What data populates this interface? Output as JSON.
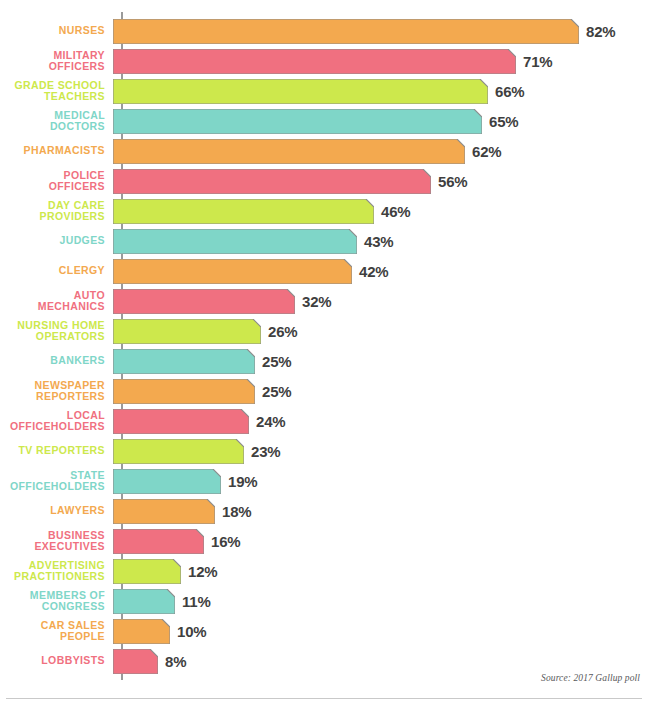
{
  "chart_data": {
    "type": "bar",
    "orientation": "horizontal",
    "title": "",
    "subtitle": "",
    "xlabel": "",
    "ylabel": "",
    "xlim": [
      0,
      82
    ],
    "grid": false,
    "legend": "none",
    "value_suffix": "%",
    "source_note": "Source: 2017 Gallup poll",
    "categories": [
      "NURSES",
      "MILITARY OFFICERS",
      "GRADE SCHOOL TEACHERS",
      "MEDICAL DOCTORS",
      "PHARMACISTS",
      "POLICE OFFICERS",
      "DAY CARE PROVIDERS",
      "JUDGES",
      "CLERGY",
      "AUTO MECHANICS",
      "NURSING HOME OPERATORS",
      "BANKERS",
      "NEWSPAPER REPORTERS",
      "LOCAL OFFICEHOLDERS",
      "TV REPORTERS",
      "STATE OFFICEHOLDERS",
      "LAWYERS",
      "BUSINESS EXECUTIVES",
      "ADVERTISING PRACTITIONERS",
      "MEMBERS OF CONGRESS",
      "CAR SALES PEOPLE",
      "LOBBYISTS"
    ],
    "values": [
      82,
      71,
      66,
      65,
      62,
      56,
      46,
      43,
      42,
      32,
      26,
      25,
      25,
      24,
      23,
      19,
      18,
      16,
      12,
      11,
      10,
      8
    ],
    "value_labels": [
      "82%",
      "71%",
      "66%",
      "65%",
      "62%",
      "56%",
      "46%",
      "43%",
      "42%",
      "32%",
      "26%",
      "25%",
      "25%",
      "24%",
      "23%",
      "19%",
      "18%",
      "16%",
      "12%",
      "11%",
      "10%",
      "8%"
    ]
  },
  "rows": [
    {
      "label": "NURSES",
      "value": 82,
      "value_label": "82%",
      "color": "#F3A94F"
    },
    {
      "label": "MILITARY\nOFFICERS",
      "value": 71,
      "value_label": "71%",
      "color": "#F07080"
    },
    {
      "label": "GRADE SCHOOL\nTEACHERS",
      "value": 66,
      "value_label": "66%",
      "color": "#CDE84C"
    },
    {
      "label": "MEDICAL\nDOCTORS",
      "value": 65,
      "value_label": "65%",
      "color": "#7FD6C8"
    },
    {
      "label": "PHARMACISTS",
      "value": 62,
      "value_label": "62%",
      "color": "#F3A94F"
    },
    {
      "label": "POLICE\nOFFICERS",
      "value": 56,
      "value_label": "56%",
      "color": "#F07080"
    },
    {
      "label": "DAY CARE\nPROVIDERS",
      "value": 46,
      "value_label": "46%",
      "color": "#CDE84C"
    },
    {
      "label": "JUDGES",
      "value": 43,
      "value_label": "43%",
      "color": "#7FD6C8"
    },
    {
      "label": "CLERGY",
      "value": 42,
      "value_label": "42%",
      "color": "#F3A94F"
    },
    {
      "label": "AUTO\nMECHANICS",
      "value": 32,
      "value_label": "32%",
      "color": "#F07080"
    },
    {
      "label": "NURSING HOME\nOPERATORS",
      "value": 26,
      "value_label": "26%",
      "color": "#CDE84C"
    },
    {
      "label": "BANKERS",
      "value": 25,
      "value_label": "25%",
      "color": "#7FD6C8"
    },
    {
      "label": "NEWSPAPER\nREPORTERS",
      "value": 25,
      "value_label": "25%",
      "color": "#F3A94F"
    },
    {
      "label": "LOCAL\nOFFICEHOLDERS",
      "value": 24,
      "value_label": "24%",
      "color": "#F07080"
    },
    {
      "label": "TV REPORTERS",
      "value": 23,
      "value_label": "23%",
      "color": "#CDE84C"
    },
    {
      "label": "STATE\nOFFICEHOLDERS",
      "value": 19,
      "value_label": "19%",
      "color": "#7FD6C8"
    },
    {
      "label": "LAWYERS",
      "value": 18,
      "value_label": "18%",
      "color": "#F3A94F"
    },
    {
      "label": "BUSINESS\nEXECUTIVES",
      "value": 16,
      "value_label": "16%",
      "color": "#F07080"
    },
    {
      "label": "ADVERTISING\nPRACTITIONERS",
      "value": 12,
      "value_label": "12%",
      "color": "#CDE84C"
    },
    {
      "label": "MEMBERS OF\nCONGRESS",
      "value": 11,
      "value_label": "11%",
      "color": "#7FD6C8"
    },
    {
      "label": "CAR SALES\nPEOPLE",
      "value": 10,
      "value_label": "10%",
      "color": "#F3A94F"
    },
    {
      "label": "LOBBYISTS",
      "value": 8,
      "value_label": "8%",
      "color": "#F07080"
    }
  ],
  "footer": {
    "source": "Source: 2017 Gallup poll"
  },
  "scale": {
    "px_per_percent": 5.68,
    "axis_x": 122
  }
}
